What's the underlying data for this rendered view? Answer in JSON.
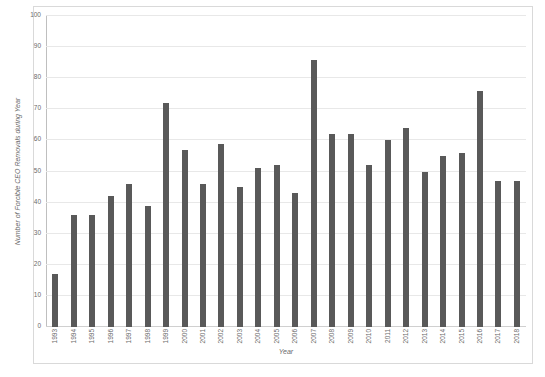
{
  "chart_data": {
    "type": "bar",
    "title": "",
    "xlabel": "Year",
    "ylabel": "Number of Forcible CEO Removals during Year",
    "ylim": [
      0,
      100
    ],
    "ytick_step": 10,
    "yticks": [
      0,
      10,
      20,
      30,
      40,
      50,
      60,
      70,
      80,
      90,
      100
    ],
    "grid": true,
    "legend": "none",
    "bar_color": "#595959",
    "gridline_color": "#e8e8e8",
    "frame_color": "#d9d9d9",
    "tick_label_color": "#6a6a6a",
    "categories": [
      "1993",
      "1994",
      "1995",
      "1996",
      "1997",
      "1998",
      "1999",
      "2000",
      "2001",
      "2002",
      "2003",
      "2004",
      "2005",
      "2006",
      "2007",
      "2008",
      "2009",
      "2010",
      "2011",
      "2012",
      "2013",
      "2014",
      "2015",
      "2016",
      "2017",
      "2018"
    ],
    "values": [
      17,
      36,
      36,
      42,
      46,
      39,
      72,
      57,
      46,
      59,
      45,
      51,
      52,
      43,
      86,
      62,
      62,
      52,
      60,
      64,
      50,
      55,
      56,
      76,
      47,
      47
    ]
  }
}
